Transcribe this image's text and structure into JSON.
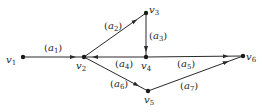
{
  "diagram": {
    "type": "directed-graph",
    "line_color": "#2a2a2a",
    "nodes": [
      {
        "id": "v1",
        "name": "v",
        "sub": "1",
        "x": 23,
        "y": 57
      },
      {
        "id": "v2",
        "name": "v",
        "sub": "2",
        "x": 84,
        "y": 57
      },
      {
        "id": "v3",
        "name": "v",
        "sub": "3",
        "x": 146,
        "y": 13
      },
      {
        "id": "v4",
        "name": "v",
        "sub": "4",
        "x": 146,
        "y": 57
      },
      {
        "id": "v5",
        "name": "v",
        "sub": "5",
        "x": 148,
        "y": 91
      },
      {
        "id": "v6",
        "name": "v",
        "sub": "6",
        "x": 243,
        "y": 56
      }
    ],
    "edges": [
      {
        "id": "a1",
        "name": "a",
        "sub": "1",
        "from": "v1",
        "to": "v2"
      },
      {
        "id": "a2",
        "name": "a",
        "sub": "2",
        "from": "v2",
        "to": "v3"
      },
      {
        "id": "a3",
        "name": "a",
        "sub": "3",
        "from": "v3",
        "to": "v4"
      },
      {
        "id": "a4",
        "name": "a",
        "sub": "4",
        "from": "v4",
        "to": "v2"
      },
      {
        "id": "a5",
        "name": "a",
        "sub": "5",
        "from": "v4",
        "to": "v6"
      },
      {
        "id": "a6",
        "name": "a",
        "sub": "6",
        "from": "v2",
        "to": "v5"
      },
      {
        "id": "a7",
        "name": "a",
        "sub": "7",
        "from": "v5",
        "to": "v6"
      }
    ]
  }
}
